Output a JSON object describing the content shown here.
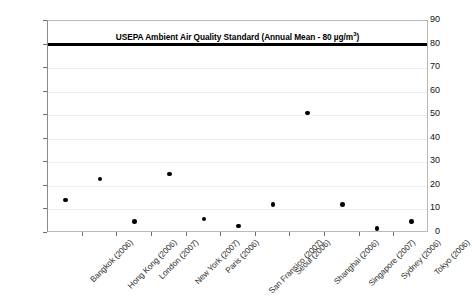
{
  "chart_data": {
    "type": "scatter",
    "title": "USEPA Ambient Air Quality Standard (Annual Mean - 80 µg/m3)",
    "title_plain": "USEPA Ambient Air Quality Standard (Annual Mean - 80 µg/m³)",
    "title_prefix": "USEPA Ambient Air Quality Standard (Annual Mean - 80 µg/m",
    "title_sup": "3",
    "title_suffix": ")",
    "xlabel": "",
    "ylabel": "Sulphur Dioxide (Annual Mean in µg/m³)",
    "ylabel_prefix": "Sulphur Dioxide (Annual Mean in µg/m",
    "ylabel_sup": "3",
    "ylabel_suffix": ")",
    "ylim": [
      0,
      90
    ],
    "ytick_step": 10,
    "yticks": [
      "90",
      "80",
      "70",
      "60",
      "50",
      "40",
      "30",
      "20",
      "10",
      "0"
    ],
    "grid": true,
    "legend": "none",
    "threshold": {
      "value": 80,
      "label": "USEPA Ambient Air Quality Standard (Annual Mean - 80 µg/m³)",
      "color": "#000000"
    },
    "marker_color": "#000000",
    "categories": [
      "Bangkok (2006)",
      "Hong Kong (2006)",
      "London (2007)",
      "New York (2007)",
      "Paris (2006)",
      "San Fransico (2007)",
      "Seoul (2006)",
      "Shanghai (2006)",
      "Singapore (2007)",
      "Sydney (2006)",
      "Tokyo (2006)"
    ],
    "values": [
      14,
      23,
      5,
      25,
      6,
      3,
      12,
      51,
      12,
      2,
      5
    ],
    "points": [
      {
        "category": "Bangkok (2006)",
        "value": 14
      },
      {
        "category": "Hong Kong (2006)",
        "value": 23
      },
      {
        "category": "London (2007)",
        "value": 5
      },
      {
        "category": "New York (2007)",
        "value": 25
      },
      {
        "category": "Paris (2006)",
        "value": 6
      },
      {
        "category": "San Fransico (2007)",
        "value": 3
      },
      {
        "category": "Seoul (2006)",
        "value": 12
      },
      {
        "category": "Shanghai (2006)",
        "value": 51
      },
      {
        "category": "Singapore (2007)",
        "value": 12
      },
      {
        "category": "Sydney (2006)",
        "value": 2
      },
      {
        "category": "Tokyo (2006)",
        "value": 5
      }
    ]
  }
}
